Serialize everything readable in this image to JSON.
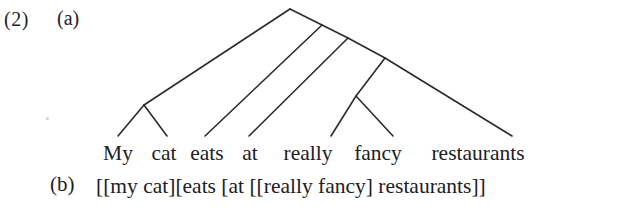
{
  "example": {
    "number": "(2)",
    "sub_a": "(a)",
    "sub_b": "(b)"
  },
  "sentence": {
    "full_text": "My cat eats at really fancy restaurants",
    "words": [
      {
        "text": "My",
        "x": 118
      },
      {
        "text": "cat",
        "x": 164
      },
      {
        "text": "eats",
        "x": 207
      },
      {
        "text": "at",
        "x": 250
      },
      {
        "text": "really",
        "x": 308
      },
      {
        "text": "fancy",
        "x": 378
      },
      {
        "text": "restaurants",
        "x": 478
      }
    ]
  },
  "bracket_notation": {
    "text": "[[my cat][eats [at [[really fancy] restaurants]]"
  },
  "tree": {
    "description": "right-branching syntactic tree over the sentence",
    "stroke_color": "#2b2b2b",
    "stroke_width": 1.6,
    "root": {
      "x": 290,
      "y": 9
    },
    "spine_nodes": [
      {
        "x": 322,
        "y": 25
      },
      {
        "x": 348,
        "y": 38
      },
      {
        "x": 385,
        "y": 58
      }
    ],
    "internal_nodes": [
      {
        "name": "np-my-cat",
        "x": 144,
        "y": 105
      },
      {
        "name": "ap-really-fancy",
        "x": 356,
        "y": 96
      }
    ],
    "leaf_tips": [
      {
        "name": "my",
        "x": 118,
        "y": 136
      },
      {
        "name": "cat",
        "x": 167,
        "y": 136
      },
      {
        "name": "eats",
        "x": 205,
        "y": 136
      },
      {
        "name": "at",
        "x": 249,
        "y": 136
      },
      {
        "name": "really",
        "x": 331,
        "y": 136
      },
      {
        "name": "fancy",
        "x": 393,
        "y": 136
      },
      {
        "name": "restaurants",
        "x": 512,
        "y": 136
      }
    ],
    "edges": [
      {
        "name": "root-to-np",
        "x1": 290,
        "y1": 9,
        "x2": 144,
        "y2": 105
      },
      {
        "name": "root-to-spine1",
        "x1": 290,
        "y1": 9,
        "x2": 322,
        "y2": 25
      },
      {
        "name": "spine1-to-eats",
        "x1": 322,
        "y1": 25,
        "x2": 205,
        "y2": 136
      },
      {
        "name": "spine1-to-spine2",
        "x1": 322,
        "y1": 25,
        "x2": 348,
        "y2": 38
      },
      {
        "name": "spine2-to-at",
        "x1": 348,
        "y1": 38,
        "x2": 249,
        "y2": 136
      },
      {
        "name": "spine2-to-spine3",
        "x1": 348,
        "y1": 38,
        "x2": 385,
        "y2": 58
      },
      {
        "name": "spine3-to-ap",
        "x1": 385,
        "y1": 58,
        "x2": 356,
        "y2": 96
      },
      {
        "name": "spine3-to-restaurants",
        "x1": 385,
        "y1": 58,
        "x2": 512,
        "y2": 136
      },
      {
        "name": "np-to-my",
        "x1": 144,
        "y1": 105,
        "x2": 118,
        "y2": 136
      },
      {
        "name": "np-to-cat",
        "x1": 144,
        "y1": 105,
        "x2": 167,
        "y2": 136
      },
      {
        "name": "ap-to-really",
        "x1": 356,
        "y1": 96,
        "x2": 331,
        "y2": 136
      },
      {
        "name": "ap-to-fancy",
        "x1": 356,
        "y1": 96,
        "x2": 393,
        "y2": 136
      }
    ]
  }
}
